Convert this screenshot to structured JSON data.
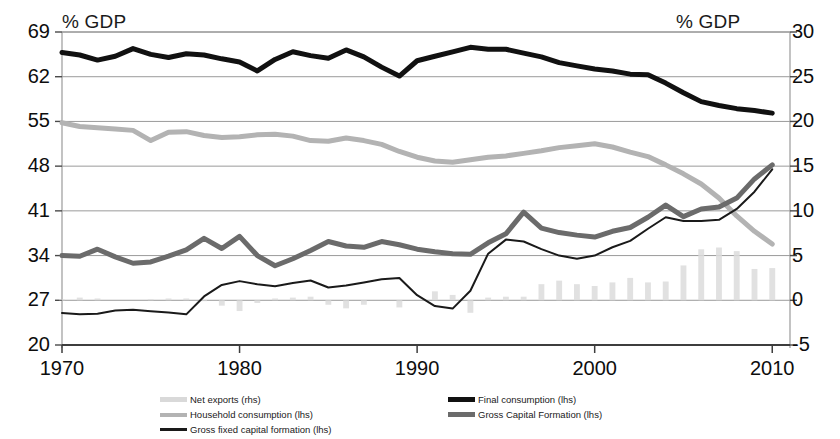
{
  "axis_titles": {
    "left": "% GDP",
    "right": "% GDP"
  },
  "legend": {
    "left_column": [
      {
        "label": "Net exports (rhs)",
        "color": "#d9d9d9",
        "style": "bar"
      },
      {
        "label": "Household consumption (lhs)",
        "color": "#b3b3b3",
        "style": "line"
      },
      {
        "label": "Gross fixed capital formation (lhs)",
        "color": "#1a1a1a",
        "style": "thin-line"
      }
    ],
    "right_column": [
      {
        "label": "Final consumption (lhs)",
        "color": "#111111",
        "style": "thick-line"
      },
      {
        "label": "Gross Capital Formation (lhs)",
        "color": "#6b6b6b",
        "style": "thick-line"
      }
    ]
  },
  "chart_data": {
    "type": "line",
    "title": "",
    "subtitle": "",
    "xlabel": "",
    "ylabel": "% GDP",
    "y2label": "% GDP",
    "grid": true,
    "legend_position": "bottom",
    "xlim": [
      1970,
      2011
    ],
    "ylim": [
      20,
      69
    ],
    "y2lim": [
      -5,
      30
    ],
    "yticks": [
      20,
      27,
      34,
      41,
      48,
      55,
      62,
      69
    ],
    "y2ticks": [
      -5,
      0,
      5,
      10,
      15,
      20,
      25,
      30
    ],
    "xticks": [
      1970,
      1980,
      1990,
      2000,
      2010
    ],
    "x": [
      1970,
      1971,
      1972,
      1973,
      1974,
      1975,
      1976,
      1977,
      1978,
      1979,
      1980,
      1981,
      1982,
      1983,
      1984,
      1985,
      1986,
      1987,
      1988,
      1989,
      1990,
      1991,
      1992,
      1993,
      1994,
      1995,
      1996,
      1997,
      1998,
      1999,
      2000,
      2001,
      2002,
      2003,
      2004,
      2005,
      2006,
      2007,
      2008,
      2009,
      2010
    ],
    "series": [
      {
        "name": "Final consumption (lhs)",
        "axis": "left",
        "color": "#111111",
        "width": 5,
        "values": [
          65.8,
          65.4,
          64.6,
          65.2,
          66.4,
          65.5,
          65.0,
          65.6,
          65.4,
          64.8,
          64.3,
          62.9,
          64.7,
          65.9,
          65.3,
          64.9,
          66.2,
          65.1,
          63.5,
          62.1,
          64.5,
          65.2,
          65.9,
          66.6,
          66.3,
          66.3,
          65.7,
          65.1,
          64.2,
          63.7,
          63.2,
          62.9,
          62.4,
          62.3,
          61.0,
          59.5,
          58.1,
          57.5,
          57.0,
          56.7,
          56.3
        ]
      },
      {
        "name": "Household consumption (lhs)",
        "axis": "left",
        "color": "#b3b3b3",
        "width": 5,
        "values": [
          54.8,
          54.2,
          54.0,
          53.8,
          53.6,
          52.0,
          53.3,
          53.4,
          52.8,
          52.5,
          52.6,
          52.9,
          53.0,
          52.7,
          52.0,
          51.9,
          52.4,
          52.0,
          51.4,
          50.3,
          49.4,
          48.8,
          48.6,
          49.0,
          49.4,
          49.6,
          50.0,
          50.4,
          50.9,
          51.2,
          51.5,
          51.0,
          50.2,
          49.5,
          48.2,
          46.8,
          45.2,
          43.0,
          40.2,
          37.8,
          35.8
        ]
      },
      {
        "name": "Gross Capital Formation (lhs)",
        "axis": "left",
        "color": "#6b6b6b",
        "width": 5,
        "values": [
          34.0,
          33.9,
          35.0,
          33.8,
          32.8,
          33.0,
          33.9,
          34.9,
          36.7,
          35.1,
          37.0,
          34.0,
          32.4,
          33.5,
          34.8,
          36.2,
          35.5,
          35.3,
          36.2,
          35.7,
          35.0,
          34.6,
          34.3,
          34.2,
          36.0,
          37.4,
          40.8,
          38.3,
          37.6,
          37.2,
          36.9,
          37.8,
          38.4,
          40.0,
          41.9,
          40.1,
          41.3,
          41.6,
          43.0,
          46.0,
          48.2
        ]
      },
      {
        "name": "Gross fixed capital formation (lhs)",
        "axis": "left",
        "color": "#1a1a1a",
        "width": 2,
        "values": [
          25.0,
          24.8,
          24.9,
          25.4,
          25.5,
          25.3,
          25.1,
          24.8,
          27.6,
          29.4,
          30.0,
          29.5,
          29.2,
          29.7,
          30.1,
          29.0,
          29.3,
          29.8,
          30.3,
          30.5,
          27.8,
          26.1,
          25.7,
          28.5,
          34.3,
          36.5,
          36.2,
          35.0,
          34.0,
          33.5,
          34.0,
          35.3,
          36.3,
          38.2,
          40.0,
          39.4,
          39.4,
          39.6,
          41.3,
          44.0,
          47.5
        ]
      }
    ],
    "bars": {
      "name": "Net exports (rhs)",
      "axis": "right",
      "color": "#dcdcdc",
      "x": [
        1970,
        1971,
        1972,
        1973,
        1974,
        1975,
        1976,
        1977,
        1978,
        1979,
        1980,
        1981,
        1982,
        1983,
        1984,
        1985,
        1986,
        1987,
        1988,
        1989,
        1990,
        1991,
        1992,
        1993,
        1994,
        1995,
        1996,
        1997,
        1998,
        1999,
        2000,
        2001,
        2002,
        2003,
        2004,
        2005,
        2006,
        2007,
        2008,
        2009,
        2010
      ],
      "values": [
        0.1,
        0.3,
        0.2,
        0.0,
        0.0,
        0.1,
        0.2,
        0.2,
        -0.1,
        -0.6,
        -1.2,
        -0.3,
        0.2,
        0.3,
        0.4,
        -0.5,
        -0.9,
        -0.5,
        0.0,
        -0.8,
        0.0,
        1.0,
        0.6,
        -1.4,
        0.3,
        0.4,
        0.4,
        1.8,
        2.2,
        1.8,
        1.6,
        2.0,
        2.5,
        2.0,
        2.1,
        3.9,
        5.7,
        5.9,
        5.5,
        3.5,
        3.6
      ]
    }
  }
}
